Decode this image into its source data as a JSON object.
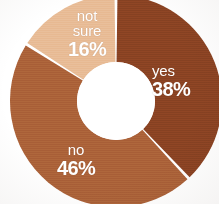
{
  "chart_data": {
    "type": "pie",
    "variant": "donut",
    "title": "",
    "subtitle": "",
    "xlabel": "",
    "ylabel": "",
    "legend": "none",
    "grid": false,
    "labels_inside_slices": true,
    "value_unit": "%",
    "categories": [
      "yes",
      "no",
      "not sure"
    ],
    "values": [
      38,
      46,
      16
    ],
    "slices": [
      {
        "label": "yes",
        "value": 38,
        "value_text": "38%",
        "color": "#8B4323",
        "start_angle_deg": 0,
        "end_angle_deg": 136.8
      },
      {
        "label": "no",
        "value": 46,
        "value_text": "46%",
        "color": "#AB6239",
        "start_angle_deg": 136.8,
        "end_angle_deg": 302.4
      },
      {
        "label": "not sure",
        "value": 16,
        "value_text": "16%",
        "label_line1": "not",
        "label_line2": "sure",
        "color": "#E8BC96",
        "start_angle_deg": 302.4,
        "end_angle_deg": 360
      }
    ],
    "colors": {
      "yes": "#8B4323",
      "no": "#AB6239",
      "not_sure": "#E8BC96",
      "hole": "#FFFFFF",
      "label_text": "#FFFFFF",
      "background": "#FFFFFF"
    },
    "geometry": {
      "center_x": 116,
      "center_y": 101,
      "outer_radius": 106,
      "inner_radius": 39,
      "gap_degrees": 1.6
    }
  }
}
